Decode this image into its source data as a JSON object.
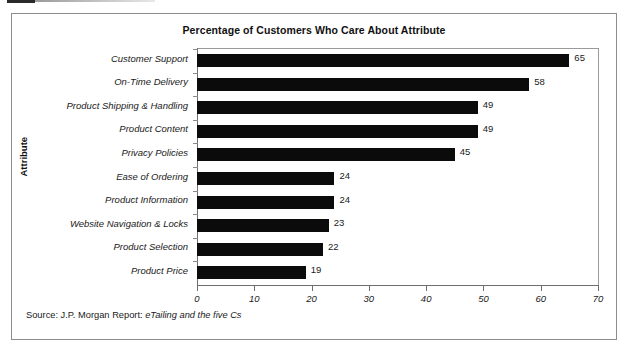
{
  "chart_data": {
    "type": "bar",
    "orientation": "horizontal",
    "title": "Percentage of Customers Who Care About Attribute",
    "xlabel": "",
    "ylabel": "Attribute",
    "categories": [
      "Customer Support",
      "On-Time Delivery",
      "Product Shipping & Handling",
      "Product Content",
      "Privacy Policies",
      "Ease of Ordering",
      "Product Information",
      "Website Navigation & Locks",
      "Product Selection",
      "Product Price"
    ],
    "values": [
      65,
      58,
      49,
      49,
      45,
      24,
      24,
      23,
      22,
      19
    ],
    "value_labels": [
      "65",
      "58",
      "49",
      "49",
      "45",
      "24",
      "24",
      "23",
      "22",
      "19"
    ],
    "xlim": [
      0,
      70
    ],
    "x_ticks": [
      0,
      10,
      20,
      30,
      40,
      50,
      60,
      70
    ],
    "x_tick_labels": [
      "0",
      "10",
      "20",
      "30",
      "40",
      "50",
      "60",
      "70"
    ],
    "grid": false,
    "legend": null,
    "bar_color": "#0b0b0b",
    "background_color": "#ffffff",
    "frame_color": "#8d8d8d"
  },
  "source": {
    "prefix": "Source: J.P. Morgan Report: ",
    "italic_part": "eTailing and the five Cs",
    "full": "Source: J.P. Morgan Report: eTailing and the five Cs"
  }
}
